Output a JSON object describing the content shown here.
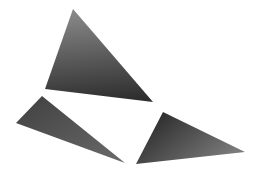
{
  "scene": {
    "background": "#ffffff",
    "shapes": [
      {
        "name": "top-triangle",
        "points": "73,9 45,89 153,102",
        "gradient": {
          "from": "#8a8a8a",
          "to": "#2e2e2e",
          "x1": "0.4",
          "y1": "0",
          "x2": "0.5",
          "y2": "1"
        }
      },
      {
        "name": "bottom-left-triangle",
        "points": "42,96 16,123 125,163",
        "gradient": {
          "from": "#404040",
          "to": "#6a6a6a",
          "x1": "0",
          "y1": "0",
          "x2": "1",
          "y2": "1"
        }
      },
      {
        "name": "bottom-right-triangle",
        "points": "163,112 136,164 245,152",
        "gradient": {
          "from": "#1e1e1e",
          "to": "#7a7a7a",
          "x1": "0",
          "y1": "0",
          "x2": "1",
          "y2": "0.6"
        }
      }
    ]
  }
}
